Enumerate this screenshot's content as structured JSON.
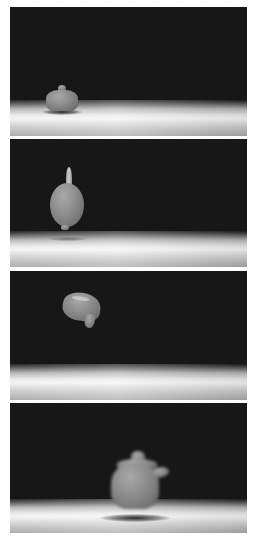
{
  "figure": {
    "panels": [
      {
        "id": 1,
        "object": "teapot-resting",
        "state": "resting on floor",
        "pose": "upright"
      },
      {
        "id": 2,
        "object": "teapot-falling",
        "state": "in air",
        "pose": "spout up, rotated"
      },
      {
        "id": 3,
        "object": "teapot-tumbling",
        "state": "in air",
        "pose": "tilted, tumbling"
      },
      {
        "id": 4,
        "object": "teapot-landing",
        "state": "just above floor",
        "pose": "upright, motion blurred"
      }
    ],
    "colors": {
      "background": "#141414",
      "floor_highlight": "#f4f4f4",
      "object": "#8e8e8e",
      "page": "#ffffff"
    }
  }
}
